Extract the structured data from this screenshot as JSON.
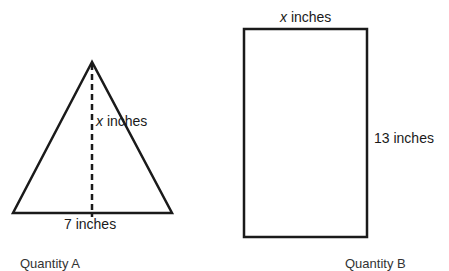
{
  "figure_a": {
    "shape": "triangle",
    "height_label": {
      "var": "x",
      "unit": " inches"
    },
    "base_label": "7 inches",
    "caption": "Quantity A"
  },
  "figure_b": {
    "shape": "rectangle",
    "width_label": {
      "var": "x",
      "unit": " inches"
    },
    "height_label": "13 inches",
    "caption": "Quantity B"
  },
  "colors": {
    "stroke": "#1a1a1a",
    "background": "#ffffff"
  }
}
